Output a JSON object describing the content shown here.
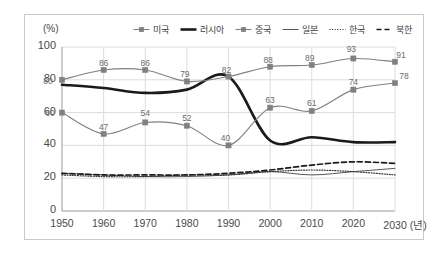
{
  "chart_data": {
    "type": "line",
    "title": "",
    "unit_label": "(%)",
    "xlabel": "(년)",
    "ylabel": "",
    "grid": true,
    "legend_position": "top",
    "xlim": [
      1950,
      2030
    ],
    "ylim": [
      0,
      100
    ],
    "y_ticks": [
      0,
      20,
      40,
      60,
      80,
      100
    ],
    "x_ticks": [
      1950,
      1960,
      1970,
      1980,
      1990,
      2000,
      2010,
      2020,
      2030
    ],
    "x_tick_labels": [
      "1950",
      "1960",
      "1970",
      "1980",
      "1990",
      "2000",
      "2010",
      "2020",
      "2030"
    ],
    "x_axis_suffix": "(년)",
    "categories": [
      1950,
      1960,
      1970,
      1980,
      1990,
      2000,
      2010,
      2020,
      2030
    ],
    "series": [
      {
        "name": "미국",
        "style": "solid-marker",
        "color": "#808080",
        "marker": "square",
        "labels_shown": true,
        "values": [
          80,
          86,
          86,
          79,
          82,
          88,
          89,
          93,
          91
        ]
      },
      {
        "name": "러시아",
        "style": "thick-solid",
        "color": "#1a1a1a",
        "marker": "none",
        "labels_shown": false,
        "values": [
          77,
          75,
          72,
          74,
          82,
          43,
          45,
          42,
          42
        ]
      },
      {
        "name": "중국",
        "style": "solid-marker",
        "color": "#808080",
        "marker": "square",
        "labels_shown": true,
        "values": [
          60,
          47,
          54,
          52,
          40,
          63,
          61,
          74,
          78
        ]
      },
      {
        "name": "일본",
        "style": "thin-solid",
        "color": "#555555",
        "marker": "none",
        "labels_shown": false,
        "values": [
          23,
          22,
          21,
          21,
          22,
          24,
          22,
          24,
          26
        ]
      },
      {
        "name": "한국",
        "style": "dotted",
        "color": "#333333",
        "marker": "none",
        "labels_shown": false,
        "values": [
          22,
          21,
          21,
          22,
          22,
          24,
          25,
          24,
          22
        ]
      },
      {
        "name": "북한",
        "style": "dashed",
        "color": "#1a1a1a",
        "marker": "none",
        "labels_shown": false,
        "values": [
          23,
          22,
          22,
          22,
          23,
          25,
          28,
          30,
          29
        ]
      }
    ],
    "point_labels": {
      "미국": [
        "80",
        "86",
        "86",
        "79",
        "82",
        "88",
        "89",
        "93",
        "91"
      ],
      "중국": [
        "60",
        "47",
        "54",
        "52",
        "40",
        "63",
        "61",
        "74",
        "78"
      ]
    }
  }
}
